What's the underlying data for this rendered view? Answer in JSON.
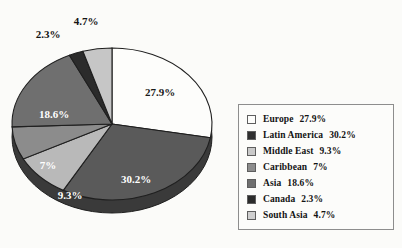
{
  "chart_data": {
    "type": "pie",
    "title": "",
    "subtitle": "",
    "xlabel": "",
    "ylabel": "",
    "grid": false,
    "legend_position": "right",
    "start_angle_deg": 0,
    "direction": "clockwise",
    "three_d": true,
    "categories": [
      "Europe",
      "Latin America",
      "Middle East",
      "Caribbean",
      "Asia",
      "Canada",
      "South Asia"
    ],
    "values": [
      27.9,
      30.2,
      9.3,
      7,
      18.6,
      2.3,
      4.7
    ],
    "value_labels": [
      "27.9%",
      "30.2%",
      "9.3%",
      "7%",
      "18.6%",
      "2.3%",
      "4.7%"
    ],
    "legend_labels": [
      "Europe  27.9%",
      "Latin America  30.2%",
      "Middle East  9.3%",
      "Caribbean  7%",
      "Asia  18.6%",
      "Canada  2.3%",
      "South Asia  4.7%"
    ],
    "slice_colors": [
      "#fdfdfb",
      "#5a5a5a",
      "#b9b9b9",
      "#8c8c8c",
      "#6f6f6f",
      "#2b2b2b",
      "#c6c6c6"
    ],
    "label_placement": [
      "inside",
      "inside",
      "inside",
      "inside",
      "inside",
      "outside",
      "outside"
    ]
  },
  "pie": {
    "slices": [
      {
        "name": "Europe",
        "pct_label": "27.9%",
        "value": 27.9,
        "color": "#fdfdfb",
        "label_x": 152,
        "label_y": 77,
        "label_class": "on-light",
        "placement": "inside"
      },
      {
        "name": "Latin America",
        "pct_label": "30.2%",
        "value": 30.2,
        "color": "#5a5a5a",
        "label_x": 128,
        "label_y": 164,
        "label_class": "on-dark",
        "placement": "inside"
      },
      {
        "name": "Middle East",
        "pct_label": "9.3%",
        "value": 9.3,
        "color": "#b9b9b9",
        "label_x": 62,
        "label_y": 180,
        "label_class": "on-dark",
        "placement": "inside"
      },
      {
        "name": "Caribbean",
        "pct_label": "7%",
        "value": 7,
        "color": "#8c8c8c",
        "label_x": 40,
        "label_y": 150,
        "label_class": "on-dark",
        "placement": "inside"
      },
      {
        "name": "Asia",
        "pct_label": "18.6%",
        "value": 18.6,
        "color": "#6f6f6f",
        "label_x": 46,
        "label_y": 99,
        "label_class": "on-dark",
        "placement": "inside"
      },
      {
        "name": "Canada",
        "pct_label": "2.3%",
        "value": 2.3,
        "color": "#2b2b2b",
        "label_x": 40,
        "label_y": 14,
        "label_class": "ext",
        "placement": "outside"
      },
      {
        "name": "South Asia",
        "pct_label": "4.7%",
        "value": 4.7,
        "color": "#c6c6c6",
        "label_x": 78,
        "label_y": 1,
        "label_class": "ext",
        "placement": "outside"
      }
    ],
    "rim_color": "#3a3a3a",
    "outline_color": "#1f1f1f"
  },
  "legend": {
    "rows": [
      {
        "label": "Europe",
        "pct": "27.9%",
        "swatch": "#fdfdfb"
      },
      {
        "label": "Latin America",
        "pct": "30.2%",
        "swatch": "#2f2f2f"
      },
      {
        "label": "Middle East",
        "pct": "9.3%",
        "swatch": "#c9c9c9"
      },
      {
        "label": "Caribbean",
        "pct": "7%",
        "swatch": "#8c8c8c"
      },
      {
        "label": "Asia",
        "pct": "18.6%",
        "swatch": "#6f6f6f"
      },
      {
        "label": "Canada",
        "pct": "2.3%",
        "swatch": "#2b2b2b"
      },
      {
        "label": "South Asia",
        "pct": "4.7%",
        "swatch": "#cfcfcf"
      }
    ]
  }
}
